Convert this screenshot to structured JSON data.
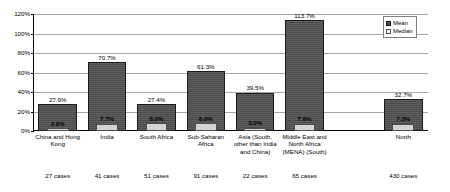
{
  "chart_data": {
    "type": "bar",
    "title": "",
    "subtitle": "",
    "xlabel": "",
    "ylabel": "",
    "ylim": [
      0,
      120
    ],
    "yticks": [
      "0%",
      "20%",
      "40%",
      "60%",
      "80%",
      "100%",
      "120%"
    ],
    "ytick_values": [
      0,
      20,
      40,
      60,
      80,
      100,
      120
    ],
    "grid": true,
    "legend_position": "top-right",
    "categories": [
      "China and Hong Kong",
      "India",
      "South Africa",
      "Sub-Saharan Africa",
      "Asia (South, other than India and China)",
      "Middle East and North Africa (MENA) (South)",
      "",
      "North"
    ],
    "case_counts": [
      "27 cases",
      "41 cases",
      "51 cases",
      "91 cases",
      "22 cases",
      "65 cases",
      "",
      "430 cases"
    ],
    "series": [
      {
        "name": "Mean",
        "color": "#4d4d4d",
        "values": [
          27.9,
          70.7,
          27.4,
          61.3,
          39.5,
          113.7,
          null,
          32.7
        ],
        "labels": [
          "27.9%",
          "70.7%",
          "27.4%",
          "61.3%",
          "39.5%",
          "113.7%",
          "",
          "32.7%"
        ]
      },
      {
        "name": "Median",
        "color": "#d4d4d4",
        "values": [
          2.8,
          7.7,
          8.0,
          8.0,
          3.0,
          7.6,
          null,
          7.3
        ],
        "labels": [
          "2.8%",
          "7.7%",
          "8.0%",
          "8.0%",
          "3.0%",
          "7.6%",
          "",
          "7.3%"
        ]
      }
    ]
  },
  "legend": {
    "items": [
      {
        "label": "Mean"
      },
      {
        "label": "Median"
      }
    ]
  }
}
